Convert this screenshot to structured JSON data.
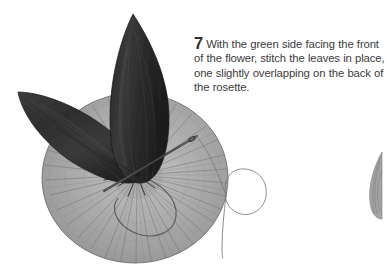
{
  "page": {
    "background_color": "#ffffff",
    "width": 386,
    "height": 271
  },
  "instruction": {
    "step_number": "7",
    "body_text": "With the green side facing the front of the flower, stitch the leaves in place, one slightly overlapping on the back of the rosette.",
    "text_color": "#3c3c3c",
    "lines": [
      "With the green side facing the",
      "front of the flower, stitch the leaves",
      "in place, one slightly overlapping",
      "on the back of the rosette."
    ]
  },
  "illustration": {
    "caption": "Fabric rosette with two dark leaves stitched at the center, threaded needle passing through",
    "colors": {
      "leaf_dark": "#2b2b2b",
      "leaf_mid": "#3b3b3b",
      "leaf_highlight": "#555555",
      "rosette_light": "#b6b6b6",
      "rosette_mid": "#9f9f9f",
      "rosette_dark": "#7e7e7e",
      "pleat_line": "#6e6e6e",
      "thread": "#6f6f6f",
      "needle": "#3a3a3a",
      "edge_outline": "#5a5a5a"
    },
    "parts": [
      {
        "name": "rosette",
        "label": "gathered fabric rosette",
        "center_x": 135,
        "center_y": 178,
        "radius": 93
      },
      {
        "name": "leaf-upright",
        "label": "upright leaf",
        "tip_x": 133,
        "tip_y": 14,
        "base_x": 146,
        "base_y": 182
      },
      {
        "name": "leaf-left",
        "label": "left angled leaf",
        "tip_x": 18,
        "tip_y": 92,
        "base_x": 140,
        "base_y": 178
      },
      {
        "name": "needle",
        "label": "sewing needle",
        "point_x": 104,
        "point_y": 191,
        "eye_x": 197,
        "eye_y": 136
      },
      {
        "name": "thread",
        "label": "thread with loose loop"
      },
      {
        "name": "gather-point",
        "label": "center gather stitching point",
        "x": 137,
        "y": 175
      },
      {
        "name": "next-step-leaf-fragment",
        "label": "partial leaf of next illustration",
        "x": 374,
        "y": 185
      }
    ],
    "pleat_count": 46
  }
}
